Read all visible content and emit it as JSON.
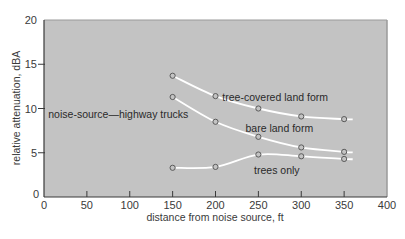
{
  "chart_data": {
    "type": "line",
    "title": "",
    "xlabel": "distance from noise source, ft",
    "ylabel": "relative attenuation, dBA",
    "xlim": [
      0,
      400
    ],
    "ylim": [
      0,
      20
    ],
    "xticks": [
      0,
      50,
      100,
      150,
      200,
      250,
      300,
      350,
      400
    ],
    "yticks": [
      0,
      5,
      10,
      15,
      20
    ],
    "grid": false,
    "legend": "none (inline labels)",
    "series": [
      {
        "name": "tree-covered land form",
        "x": [
          150,
          200,
          250,
          300,
          350
        ],
        "y": [
          13.7,
          11.4,
          10.0,
          9.1,
          8.8
        ],
        "curve_end_x": 360
      },
      {
        "name": "bare land form",
        "x": [
          150,
          200,
          250,
          300,
          350
        ],
        "y": [
          11.3,
          8.5,
          6.8,
          5.6,
          5.1
        ],
        "curve_end_x": 360
      },
      {
        "name": "trees only",
        "x": [
          150,
          200,
          250,
          300,
          350
        ],
        "y": [
          3.3,
          3.4,
          4.8,
          4.6,
          4.3
        ],
        "curve_end_x": 360
      }
    ],
    "annotations": [
      {
        "text": "noise-source—highway trucks",
        "x": 5,
        "y": 8.9
      },
      {
        "text": "tree-covered land form",
        "x": 208,
        "y": 10.9
      },
      {
        "text": "bare land form",
        "x": 235,
        "y": 7.3
      },
      {
        "text": "trees only",
        "x": 245,
        "y": 2.6
      }
    ]
  },
  "colors": {
    "plot_background": "#c3c3c3",
    "curve": "#ffffff",
    "marker_edge": "#5a5a5a",
    "axis": "#3a3a3a",
    "text": "#3a3a3a"
  }
}
